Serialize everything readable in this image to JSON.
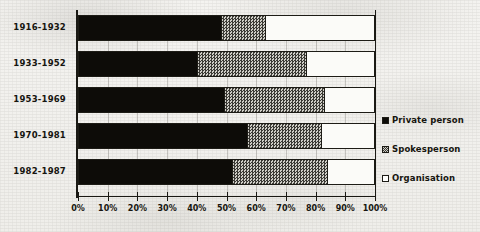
{
  "chart_data": {
    "type": "bar",
    "orientation": "horizontal",
    "stacked": true,
    "normalized_percent": true,
    "title": "",
    "subtitle": "",
    "xlabel": "",
    "ylabel": "",
    "xlim": [
      0,
      100
    ],
    "grid": true,
    "legend_position": "right",
    "categories": [
      "1916-1932",
      "1933-1952",
      "1953-1969",
      "1970-1981",
      "1982-1987"
    ],
    "xticks": [
      "0%",
      "10%",
      "20%",
      "30%",
      "40%",
      "50%",
      "60%",
      "70%",
      "80%",
      "90%",
      "100%"
    ],
    "xtick_values": [
      0,
      10,
      20,
      30,
      40,
      50,
      60,
      70,
      80,
      90,
      100
    ],
    "series": [
      {
        "name": "Private person",
        "key": "priv",
        "fill": "solid-black",
        "color": "#0d0c08",
        "values": [
          48,
          40,
          49,
          57,
          52
        ]
      },
      {
        "name": "Spokesperson",
        "key": "spoke",
        "fill": "checkered-gray",
        "color": "#9b9a93",
        "values": [
          15,
          37,
          34,
          25,
          32
        ]
      },
      {
        "name": "Organisation",
        "key": "org",
        "fill": "white-outlined",
        "color": "#fbfbf8",
        "values": [
          37,
          23,
          17,
          18,
          16
        ]
      }
    ]
  },
  "legend": {
    "items": [
      {
        "label": "Private person",
        "key": "priv"
      },
      {
        "label": "Spokesperson",
        "key": "spoke"
      },
      {
        "label": "Organisation",
        "key": "org"
      }
    ]
  },
  "colors": {
    "background": "#f2f1ee",
    "ink": "#16150f",
    "private_person": "#0d0c08",
    "spokesperson": "#9b9a93",
    "organisation": "#fbfbf8"
  }
}
